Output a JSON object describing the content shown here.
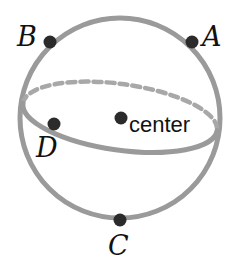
{
  "figure": {
    "name": "sphere-with-labeled-points",
    "canvas": {
      "width": 236,
      "height": 268,
      "background": "#ffffff"
    },
    "colors": {
      "outline_gray": "#9a9a9a",
      "equator_gray": "#9a9a9a",
      "dashed_gray": "#a8a8a8",
      "point_dark": "#2b2b2b",
      "label_text": "#111111",
      "background": "#ffffff"
    },
    "sphere": {
      "shape": "circle",
      "center_x": 120,
      "center_y": 118,
      "radius": 100,
      "stroke_width": 5
    },
    "equator": {
      "shape": "ellipse",
      "center_x": 120,
      "center_y": 117,
      "semi_major": 98,
      "semi_minor": 33,
      "rotation_deg": 8,
      "stroke_width": 5,
      "front_style": "solid",
      "back_style": "dashed",
      "dash_pattern": "8 5"
    },
    "points": [
      {
        "id": "A",
        "label": "A",
        "x": 192,
        "y": 42,
        "radius": 6.5,
        "label_x": 202,
        "label_y": 23
      },
      {
        "id": "B",
        "label": "B",
        "x": 50,
        "y": 42,
        "radius": 6.5,
        "label_x": 17,
        "label_y": 23
      },
      {
        "id": "C",
        "label": "C",
        "x": 120,
        "y": 220,
        "radius": 6.5,
        "label_x": 108,
        "label_y": 232
      },
      {
        "id": "D",
        "label": "D",
        "x": 54,
        "y": 124,
        "radius": 6.5,
        "label_x": 36,
        "label_y": 134
      },
      {
        "id": "center",
        "label": "center",
        "x": 121,
        "y": 118,
        "radius": 6.5,
        "label_x": 129,
        "label_y": 114
      }
    ]
  }
}
